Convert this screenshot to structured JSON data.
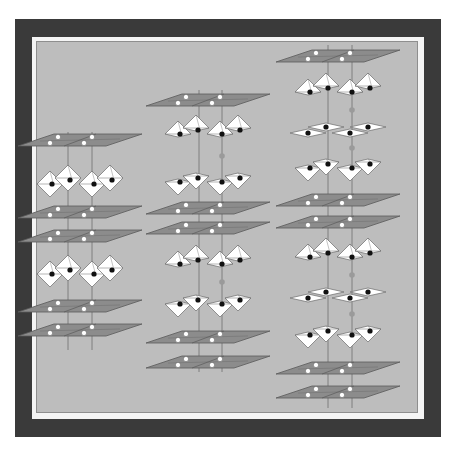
{
  "figure": {
    "colors": {
      "frame": "#3a3a3a",
      "inner_border": "#f4f4f4",
      "panel": "#bdbdbd",
      "plane_fill": "#8c8c8c",
      "plane_stroke": "#5a5a5a",
      "octa_fill": "#ffffff",
      "octa_stroke": "#6a6a6a",
      "white_atom": "#ffffff",
      "black_atom": "#111111",
      "axis_line": "#6f6f6f",
      "ghost_atom": "#9a9a9a"
    },
    "columns": [
      {
        "name": "column-left",
        "cx": 80,
        "axis_x": [
          68,
          92
        ],
        "axis_range": [
          132,
          350
        ],
        "layers": [
          {
            "type": "plane",
            "y": 140
          },
          {
            "type": "octa",
            "y": 182
          },
          {
            "type": "plane",
            "y": 212
          },
          {
            "type": "plane",
            "y": 236
          },
          {
            "type": "octa",
            "y": 272
          },
          {
            "type": "plane",
            "y": 306
          },
          {
            "type": "plane",
            "y": 330
          }
        ]
      },
      {
        "name": "column-middle",
        "cx": 208,
        "axis_x": [
          199,
          222
        ],
        "axis_range": [
          90,
          372
        ],
        "layers": [
          {
            "type": "plane",
            "y": 100
          },
          {
            "type": "octa-up",
            "y": 132
          },
          {
            "type": "octa-down",
            "y": 180
          },
          {
            "type": "plane",
            "y": 208
          },
          {
            "type": "plane",
            "y": 228
          },
          {
            "type": "octa-up",
            "y": 262
          },
          {
            "type": "octa-down",
            "y": 302
          },
          {
            "type": "plane",
            "y": 337
          },
          {
            "type": "plane",
            "y": 362
          }
        ]
      },
      {
        "name": "column-right",
        "cx": 338,
        "axis_x": [
          328,
          352
        ],
        "axis_range": [
          45,
          408
        ],
        "layers": [
          {
            "type": "plane",
            "y": 56
          },
          {
            "type": "octa-up",
            "y": 90
          },
          {
            "type": "flat",
            "y": 130
          },
          {
            "type": "octa-down",
            "y": 166
          },
          {
            "type": "plane",
            "y": 200
          },
          {
            "type": "plane",
            "y": 222
          },
          {
            "type": "octa-up",
            "y": 255
          },
          {
            "type": "flat",
            "y": 295
          },
          {
            "type": "octa-down",
            "y": 333
          },
          {
            "type": "plane",
            "y": 368
          },
          {
            "type": "plane",
            "y": 392
          }
        ]
      }
    ]
  }
}
